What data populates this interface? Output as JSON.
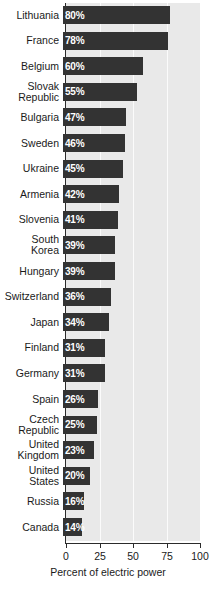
{
  "chart_data": {
    "type": "bar",
    "orientation": "horizontal",
    "title": "",
    "xlabel": "Percent of electric power",
    "ylabel": "",
    "xlim": [
      0,
      100
    ],
    "xticks": [
      "0",
      "25",
      "50",
      "75",
      "100"
    ],
    "xtick_values": [
      0,
      25,
      50,
      75,
      100
    ],
    "grid": true,
    "grid_axis": "x",
    "legend": "none",
    "bar_color": "#333333",
    "plot_background": "#e9e9e9",
    "gridline_color": "#fbfbfb",
    "value_label_color": "#ffffff",
    "categories": [
      "Lithuania",
      "France",
      "Belgium",
      "Slovak\nRepublic",
      "Bulgaria",
      "Sweden",
      "Ukraine",
      "Armenia",
      "Slovenia",
      "South\nKorea",
      "Hungary",
      "Switzerland",
      "Japan",
      "Finland",
      "Germany",
      "Spain",
      "Czech\nRepublic",
      "United\nKingdom",
      "United\nStates",
      "Russia",
      "Canada"
    ],
    "values": [
      80,
      78,
      60,
      55,
      47,
      46,
      45,
      42,
      41,
      39,
      39,
      36,
      34,
      31,
      31,
      26,
      25,
      23,
      20,
      16,
      14
    ],
    "value_labels": [
      "80%",
      "78%",
      "60%",
      "55%",
      "47%",
      "46%",
      "45%",
      "42%",
      "41%",
      "39%",
      "39%",
      "36%",
      "34%",
      "31%",
      "31%",
      "26%",
      "25%",
      "23%",
      "20%",
      "16%",
      "14%"
    ]
  }
}
